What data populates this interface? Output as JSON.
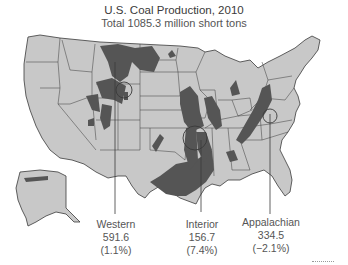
{
  "title": "U.S. Coal Production, 2010",
  "subtitle": "Total 1085.3 million short tons",
  "colors": {
    "land": "#c8c8c8",
    "coal": "#555555",
    "border": "#3a3a3a",
    "background": "#ffffff"
  },
  "regions": [
    {
      "name": "Western",
      "value": "591.6",
      "change": "(1.1%)"
    },
    {
      "name": "Interior",
      "value": "156.7",
      "change": "(7.4%)"
    },
    {
      "name": "Appalachian",
      "value": "334.5",
      "change": "(−2.1%)"
    }
  ]
}
